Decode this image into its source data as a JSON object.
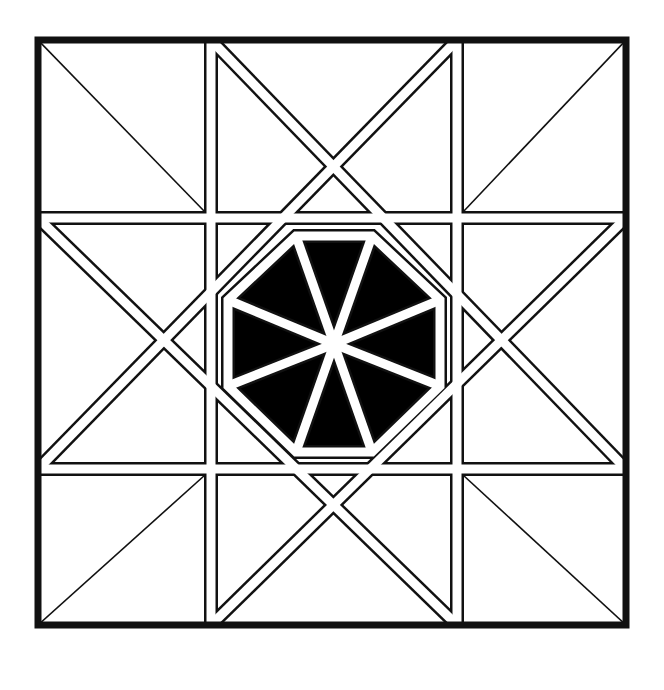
{
  "artwork": {
    "title": "Octagon star quilt block",
    "colors": {
      "line": "#111111",
      "background": "#ffffff"
    },
    "frame": {
      "x": 38,
      "y": 40,
      "w": 588,
      "h": 585
    },
    "grid": {
      "v": [
        211,
        457
      ],
      "h": [
        218,
        469
      ]
    },
    "octagon_spokes": 8
  }
}
